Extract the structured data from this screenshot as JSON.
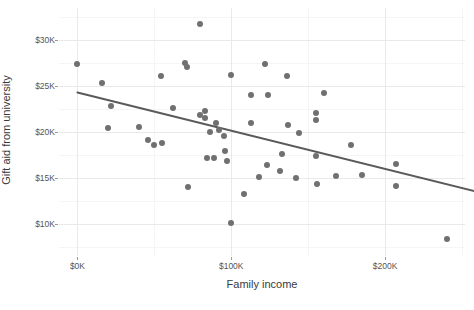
{
  "chart_data": {
    "type": "scatter",
    "title": "",
    "xlabel": "Family income",
    "ylabel": "Gift aid from university",
    "xlim": [
      -12000,
      252000
    ],
    "ylim": [
      6500,
      33500
    ],
    "grid": true,
    "legend": false,
    "x_ticks": [
      {
        "value": 0,
        "label": "$0K"
      },
      {
        "value": 100000,
        "label": "$100K"
      },
      {
        "value": 200000,
        "label": "$200K"
      }
    ],
    "x_minor_ticks": [
      50000,
      150000,
      250000
    ],
    "y_ticks": [
      {
        "value": 30000,
        "label": "$30K"
      },
      {
        "value": 25000,
        "label": "$25K"
      },
      {
        "value": 20000,
        "label": "$20K"
      },
      {
        "value": 15000,
        "label": "$15K"
      },
      {
        "value": 10000,
        "label": "$10K"
      }
    ],
    "y_minor_ticks": [
      32500,
      27500,
      22500,
      17500,
      12500,
      7500
    ],
    "point_color": "#707070",
    "point_size": 6,
    "gridline_color": "#e9e9e9",
    "minor_gridline_color": "#f5f5f5",
    "background_color": "#ffffff",
    "points": [
      {
        "x": 80000,
        "y": 31800
      },
      {
        "x": 0,
        "y": 27400
      },
      {
        "x": 70000,
        "y": 27500
      },
      {
        "x": 71000,
        "y": 27100
      },
      {
        "x": 122000,
        "y": 27400
      },
      {
        "x": 54000,
        "y": 26100
      },
      {
        "x": 100000,
        "y": 26200
      },
      {
        "x": 136000,
        "y": 26100
      },
      {
        "x": 16000,
        "y": 25300
      },
      {
        "x": 113000,
        "y": 24000
      },
      {
        "x": 124000,
        "y": 24000
      },
      {
        "x": 160000,
        "y": 24200
      },
      {
        "x": 22000,
        "y": 22800
      },
      {
        "x": 62000,
        "y": 22600
      },
      {
        "x": 83000,
        "y": 22300
      },
      {
        "x": 83000,
        "y": 21500
      },
      {
        "x": 80000,
        "y": 21800
      },
      {
        "x": 155000,
        "y": 22100
      },
      {
        "x": 155000,
        "y": 21300
      },
      {
        "x": 90000,
        "y": 21000
      },
      {
        "x": 113000,
        "y": 21000
      },
      {
        "x": 20000,
        "y": 20400
      },
      {
        "x": 40000,
        "y": 20500
      },
      {
        "x": 86000,
        "y": 20000
      },
      {
        "x": 92000,
        "y": 20200
      },
      {
        "x": 95000,
        "y": 19600
      },
      {
        "x": 144000,
        "y": 19900
      },
      {
        "x": 137000,
        "y": 20800
      },
      {
        "x": 46000,
        "y": 19100
      },
      {
        "x": 55000,
        "y": 18800
      },
      {
        "x": 50000,
        "y": 18600
      },
      {
        "x": 96000,
        "y": 17900
      },
      {
        "x": 178000,
        "y": 18600
      },
      {
        "x": 133000,
        "y": 17600
      },
      {
        "x": 155000,
        "y": 17400
      },
      {
        "x": 84000,
        "y": 17200
      },
      {
        "x": 89000,
        "y": 17200
      },
      {
        "x": 97000,
        "y": 16800
      },
      {
        "x": 123000,
        "y": 16400
      },
      {
        "x": 207000,
        "y": 16500
      },
      {
        "x": 118000,
        "y": 15100
      },
      {
        "x": 132000,
        "y": 15700
      },
      {
        "x": 142000,
        "y": 15000
      },
      {
        "x": 168000,
        "y": 15200
      },
      {
        "x": 185000,
        "y": 15300
      },
      {
        "x": 156000,
        "y": 14300
      },
      {
        "x": 207000,
        "y": 14100
      },
      {
        "x": 72000,
        "y": 14000
      },
      {
        "x": 108000,
        "y": 13200
      },
      {
        "x": 100000,
        "y": 10100
      },
      {
        "x": 240000,
        "y": 8400
      }
    ],
    "trendline": {
      "type": "linear",
      "color": "#5a5a5a",
      "x_start": 0,
      "y_start": 24300,
      "x_end": 267000,
      "y_end": 13200
    }
  }
}
